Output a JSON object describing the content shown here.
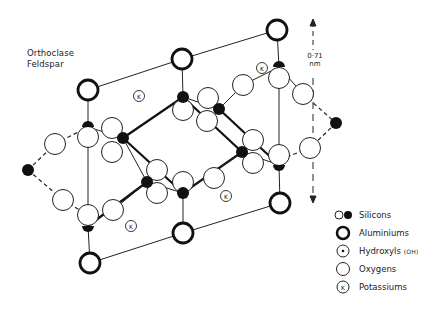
{
  "title": {
    "line1": "Orthoclase",
    "line2": "Feldspar"
  },
  "scale": {
    "value": "0·71",
    "unit": "nm"
  },
  "legend": {
    "items": [
      {
        "symbol": "silicon-open-and-filled",
        "label": "Silicons"
      },
      {
        "symbol": "aluminium-thick-ring",
        "label": "Aluminiums"
      },
      {
        "symbol": "hydroxyl-dot-ring",
        "label": "Hydroxyls",
        "sublabel": "(OH)"
      },
      {
        "symbol": "oxygen-ring",
        "label": "Oxygens"
      },
      {
        "symbol": "potassium-k-ring",
        "label": "Potassiums"
      }
    ]
  },
  "atoms": {
    "potassium_label": "K"
  },
  "colors": {
    "ink": "#111111",
    "background": "#ffffff"
  }
}
